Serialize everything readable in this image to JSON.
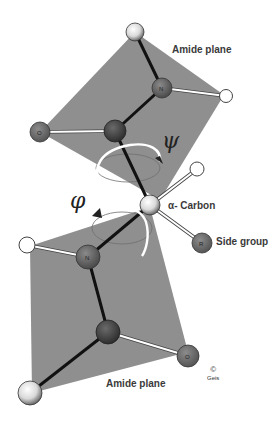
{
  "diagram": {
    "labels": {
      "amide_plane_top": "Amide plane",
      "amide_plane_bottom": "Amide plane",
      "alpha_carbon": "α- Carbon",
      "side_group": "Side group",
      "psi": "ψ",
      "phi": "φ",
      "copyright_symbol": "©",
      "copyright_mark": "Geis"
    },
    "atom_letters": {
      "top_N": "N",
      "top_O": "O",
      "side_R": "R",
      "bottom_N": "N",
      "bottom_O": "O"
    },
    "colors": {
      "plane": "#8f8f8f",
      "bond_backbone": "#111111",
      "bond_white": "#ffffff",
      "atom_dark": "#4a4a4a",
      "atom_N": "#5e5e5e",
      "atom_O": "#6e6e6e",
      "atom_H": "#ffffff",
      "atom_speckled": "#d8d8d8"
    }
  }
}
